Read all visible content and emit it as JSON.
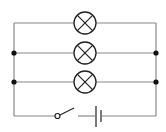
{
  "diagram": {
    "type": "electrical-circuit",
    "components": {
      "lamps": [
        {
          "id": "lamp-1",
          "symbol": "lamp-cross-circle"
        },
        {
          "id": "lamp-2",
          "symbol": "lamp-cross-circle"
        },
        {
          "id": "lamp-3",
          "symbol": "lamp-cross-circle"
        }
      ],
      "switch": {
        "symbol": "open-switch",
        "state": "open"
      },
      "battery": {
        "symbol": "cell"
      },
      "junctions": 4
    },
    "colors": {
      "wire": "#888888",
      "symbol": "#222222",
      "junction": "#111111",
      "background": "#ffffff"
    }
  }
}
